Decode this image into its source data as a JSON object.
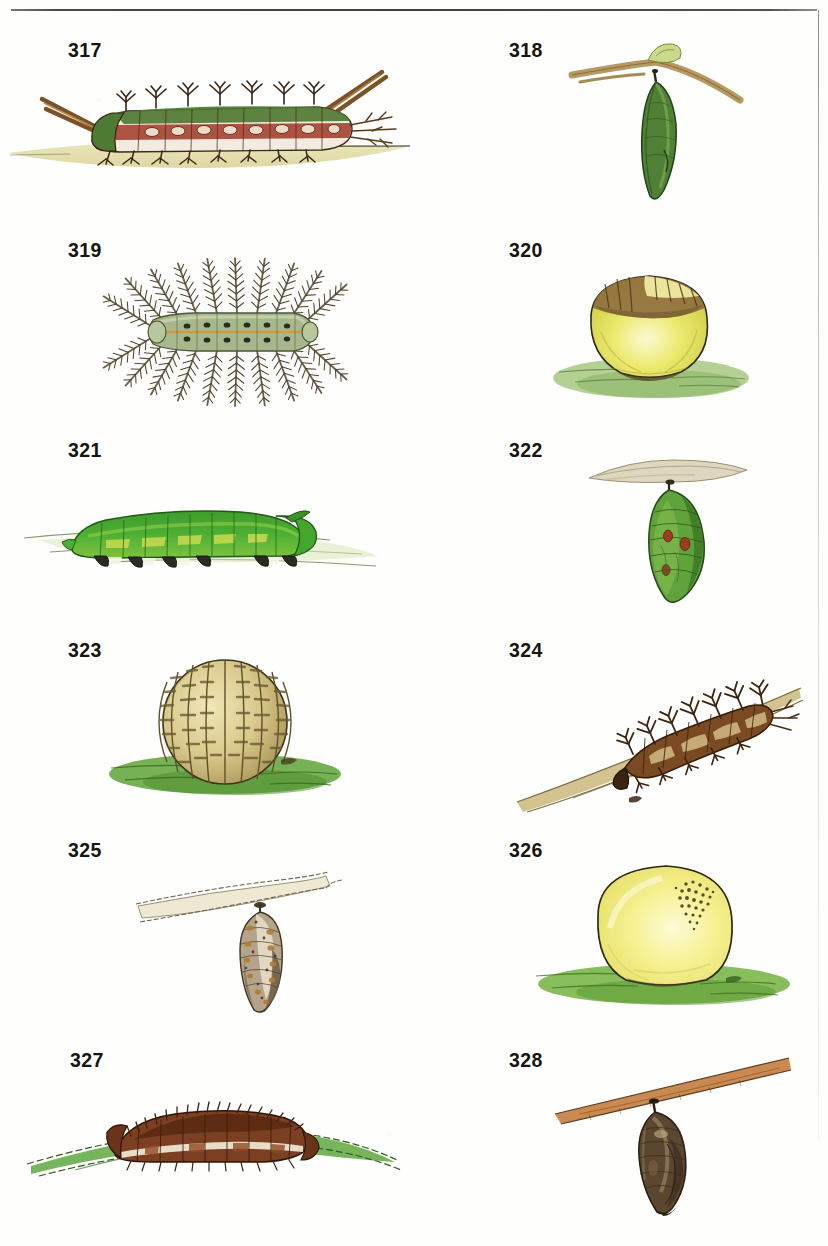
{
  "page": {
    "kind": "illustrated-plate",
    "background_color": "#fefefc",
    "rule_color": "#2f2d29",
    "label_color": "#16150f",
    "columns": 2,
    "rows": 6
  },
  "figures": [
    {
      "number": "317",
      "label": "317",
      "column": "left",
      "row": 1,
      "subject": "spiny-caterpillar-on-ground",
      "icon": "caterpillar-icon",
      "colors": {
        "body": "#a94b3a",
        "band": "#f2ece0",
        "dorsal": "#4f7a34",
        "spines": "#6d4524",
        "ground": "#ddd79a"
      }
    },
    {
      "number": "318",
      "label": "318",
      "column": "right",
      "row": 1,
      "subject": "green-chrysalis-hanging-from-twig",
      "icon": "chrysalis-icon",
      "colors": {
        "body": "#4f8036",
        "twig": "#b79a62",
        "leaf": "#c8d98a"
      }
    },
    {
      "number": "319",
      "label": "319",
      "column": "left",
      "row": 2,
      "subject": "plumed-hairy-caterpillar-dorsal-view",
      "icon": "caterpillar-icon",
      "colors": {
        "body": "#a7b98c",
        "plumes": "#6f6248",
        "stripe": "#d4a94f",
        "spots": "#2b2a24"
      }
    },
    {
      "number": "320",
      "label": "320",
      "column": "right",
      "row": 2,
      "subject": "yellow-round-pupa-on-grass",
      "icon": "pupa-icon",
      "colors": {
        "body": "#e3e055",
        "cap": "#8c6b3c",
        "ground": "#9cc070"
      }
    },
    {
      "number": "321",
      "label": "321",
      "column": "left",
      "row": 3,
      "subject": "smooth-green-caterpillar-on-leaf",
      "icon": "caterpillar-icon",
      "colors": {
        "body": "#45a331",
        "highlight": "#c9dd4f",
        "prolegs": "#2c2a22",
        "ground": "#d7e7bc"
      }
    },
    {
      "number": "322",
      "label": "322",
      "column": "right",
      "row": 3,
      "subject": "green-chrysalis-with-red-spots-under-leaf",
      "icon": "chrysalis-icon",
      "colors": {
        "body": "#5fa33a",
        "spots": "#9c3d22",
        "leaf": "#ded6bd"
      }
    },
    {
      "number": "323",
      "label": "323",
      "column": "left",
      "row": 4,
      "subject": "ribbed-spherical-cocoon-on-grass",
      "icon": "cocoon-icon",
      "colors": {
        "body": "#d8c88a",
        "ribs": "#6a5c34",
        "ground": "#63a63f"
      }
    },
    {
      "number": "324",
      "label": "324",
      "column": "right",
      "row": 4,
      "subject": "spiny-brown-caterpillar-on-stem",
      "icon": "caterpillar-icon",
      "colors": {
        "body": "#7a4a22",
        "spines": "#4a2d14",
        "pale": "#d6c089",
        "stem": "#cdbd84"
      }
    },
    {
      "number": "325",
      "label": "325",
      "column": "left",
      "row": 5,
      "subject": "mottled-brown-chrysalis-hanging-from-leaf",
      "icon": "chrysalis-icon",
      "colors": {
        "body": "#8d7a5f",
        "mottle": "#b27b33",
        "pale": "#ece4d2",
        "leaf": "#efe9d4"
      }
    },
    {
      "number": "326",
      "label": "326",
      "column": "right",
      "row": 5,
      "subject": "pale-yellow-egg-shaped-pupa-on-grass",
      "icon": "pupa-icon",
      "colors": {
        "body": "#f3ef86",
        "speckles": "#554d2c",
        "ground": "#78b445"
      }
    },
    {
      "number": "327",
      "label": "327",
      "column": "left",
      "row": 6,
      "subject": "bristly-brown-caterpillar-on-grass-blade",
      "icon": "caterpillar-icon",
      "colors": {
        "body": "#7b3f22",
        "stripe": "#f1e9d6",
        "bristles": "#42220f",
        "ground": "#67ad4a"
      }
    },
    {
      "number": "328",
      "label": "328",
      "column": "right",
      "row": 6,
      "subject": "dark-brown-chrysalis-hanging-from-stem",
      "icon": "chrysalis-icon",
      "colors": {
        "body": "#5b4630",
        "highlight": "#b8a47e",
        "stem": "#c47f42"
      }
    }
  ]
}
